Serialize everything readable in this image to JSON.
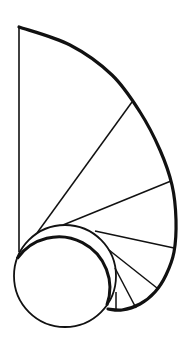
{
  "diagram": {
    "type": "geometric-line-drawing",
    "stroke_color": "#111111",
    "background": "#ffffff",
    "circle": {
      "cx": 65,
      "cy": 276,
      "r": 51
    },
    "vertical_line": {
      "x1": 19,
      "y1": 27,
      "x2": 19,
      "y2": 252
    },
    "outer_curve_points": [
      [
        19,
        27
      ],
      [
        70,
        45
      ],
      [
        112,
        75
      ],
      [
        140,
        112
      ],
      [
        160,
        150
      ],
      [
        172,
        185
      ],
      [
        176,
        220
      ],
      [
        174,
        252
      ],
      [
        166,
        275
      ],
      [
        155,
        292
      ],
      [
        140,
        304
      ],
      [
        122,
        310
      ],
      [
        108,
        309
      ]
    ],
    "rays": [
      {
        "x1": 37,
        "y1": 233,
        "x2": 132,
        "y2": 102
      },
      {
        "x1": 63,
        "y1": 225,
        "x2": 171,
        "y2": 181
      },
      {
        "x1": 95,
        "y1": 231,
        "x2": 174,
        "y2": 248
      },
      {
        "x1": 109,
        "y1": 250,
        "x2": 157,
        "y2": 288
      },
      {
        "x1": 115,
        "y1": 268,
        "x2": 136,
        "y2": 308
      },
      {
        "x1": 116,
        "y1": 292,
        "x2": 116,
        "y2": 310
      }
    ]
  }
}
